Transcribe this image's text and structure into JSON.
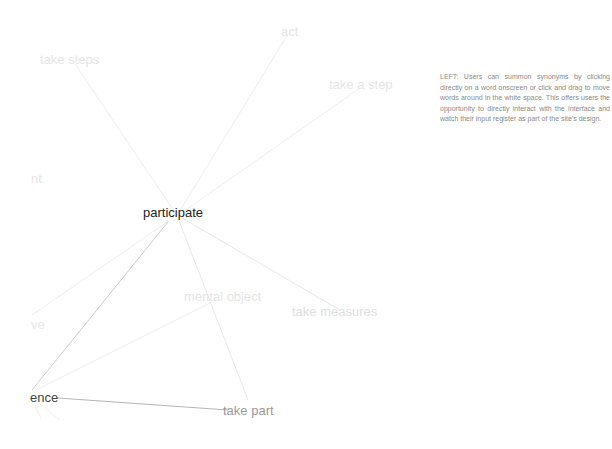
{
  "graph": {
    "center_word": {
      "label": "participate",
      "x": 143,
      "y": 206,
      "size": 13,
      "color": "#222222"
    },
    "words": [
      {
        "label": "act",
        "x": 281,
        "y": 25,
        "size": 13,
        "color": "#e6e6e6"
      },
      {
        "label": "take steps",
        "x": 40,
        "y": 53,
        "size": 13,
        "color": "#e6e6e6"
      },
      {
        "label": "take a step",
        "x": 329,
        "y": 78,
        "size": 13,
        "color": "#e6e6e6"
      },
      {
        "label": "nt",
        "x": 31,
        "y": 172,
        "size": 13,
        "color": "#e6e6e6"
      },
      {
        "label": "mental object",
        "x": 184,
        "y": 290,
        "size": 13,
        "color": "#e6e6e6"
      },
      {
        "label": "take measures",
        "x": 292,
        "y": 305,
        "size": 13,
        "color": "#e0e0e0"
      },
      {
        "label": "ve",
        "x": 31,
        "y": 318,
        "size": 13,
        "color": "#e6e6e6"
      },
      {
        "label": "ence",
        "x": 30,
        "y": 391,
        "size": 13,
        "color": "#444444"
      },
      {
        "label": "take part",
        "x": 223,
        "y": 404,
        "size": 13,
        "color": "#999999"
      }
    ],
    "edges": [
      {
        "x1": 176,
        "y1": 214,
        "x2": 75,
        "y2": 64,
        "color": "#eeeeee"
      },
      {
        "x1": 178,
        "y1": 214,
        "x2": 288,
        "y2": 34,
        "color": "#eeeeee"
      },
      {
        "x1": 180,
        "y1": 214,
        "x2": 360,
        "y2": 88,
        "color": "#eeeeee"
      },
      {
        "x1": 182,
        "y1": 218,
        "x2": 340,
        "y2": 310,
        "color": "#e8e8e8"
      },
      {
        "x1": 178,
        "y1": 218,
        "x2": 248,
        "y2": 400,
        "color": "#e8e8e8"
      },
      {
        "x1": 170,
        "y1": 220,
        "x2": 32,
        "y2": 315,
        "color": "#eeeeee"
      },
      {
        "x1": 168,
        "y1": 222,
        "x2": 32,
        "y2": 390,
        "color": "#cfcfcf"
      },
      {
        "x1": 212,
        "y1": 302,
        "x2": 36,
        "y2": 390,
        "color": "#eeeeee"
      },
      {
        "x1": 58,
        "y1": 398,
        "x2": 228,
        "y2": 410,
        "color": "#b5b5b5"
      },
      {
        "x1": 34,
        "y1": 404,
        "x2": 42,
        "y2": 420,
        "color": "#f0f0f0"
      },
      {
        "x1": 40,
        "y1": 404,
        "x2": 60,
        "y2": 420,
        "color": "#f0f0f0"
      }
    ]
  },
  "description": {
    "text": "LEFT: Users can summon synonyms by clicking directly on a word onscreen or click and drag to move words around in the white space. This offers users the opportunity to directly interact with the interface and watch their input register as part of the site's design."
  }
}
